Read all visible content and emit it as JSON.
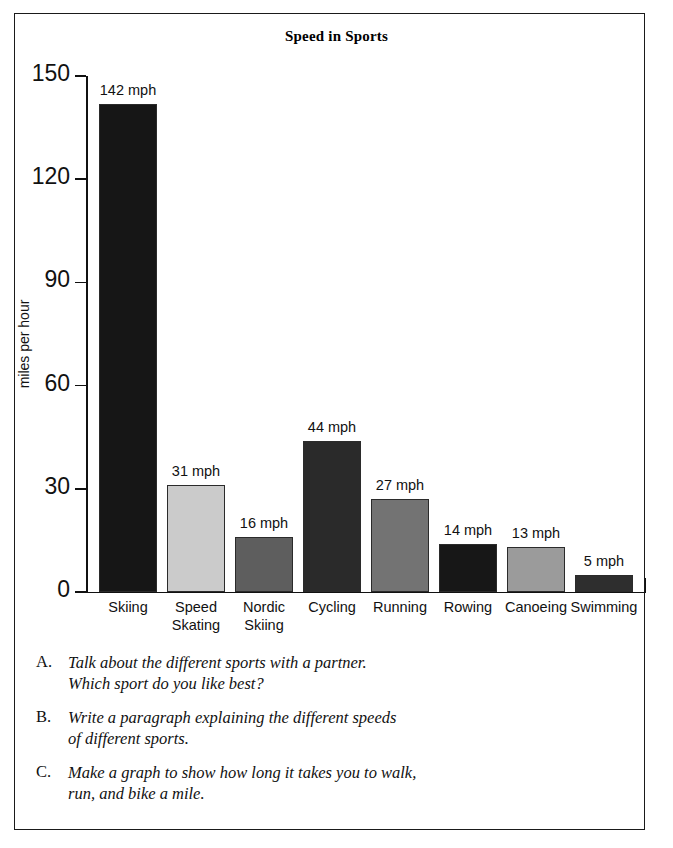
{
  "frame": {
    "border_color": "#1a1a1a"
  },
  "chart_data": {
    "type": "bar",
    "title": "Speed in Sports",
    "xlabel": "",
    "ylabel": "miles per hour",
    "ylim": [
      0,
      150
    ],
    "yticks": [
      0,
      30,
      60,
      90,
      120,
      150
    ],
    "grid": false,
    "legend": false,
    "value_suffix": "mph",
    "categories": [
      "Skiing",
      "Speed Skating",
      "Nordic Skiing",
      "Cycling",
      "Running",
      "Rowing",
      "Canoeing",
      "Swimming"
    ],
    "values": [
      142,
      31,
      16,
      44,
      27,
      14,
      13,
      5
    ],
    "value_labels": [
      "142 mph",
      "31 mph",
      "16 mph",
      "44 mph",
      "27 mph",
      "14 mph",
      "13 mph",
      "5 mph"
    ],
    "category_label_lines": [
      [
        "Skiing"
      ],
      [
        "Speed",
        "Skating"
      ],
      [
        "Nordic",
        "Skiing"
      ],
      [
        "Cycling"
      ],
      [
        "Running"
      ],
      [
        "Rowing"
      ],
      [
        "Canoeing"
      ],
      [
        "Swimming"
      ]
    ],
    "bar_colors": [
      "#161616",
      "#cbcbcb",
      "#5e5e5e",
      "#2a2a2a",
      "#737373",
      "#171717",
      "#9b9b9b",
      "#2e2e2e"
    ]
  },
  "questions": [
    {
      "marker": "A.",
      "text": "Talk about the different sports with a partner.\nWhich sport do you like best?"
    },
    {
      "marker": "B.",
      "text": "Write a paragraph explaining the different speeds\nof different sports."
    },
    {
      "marker": "C.",
      "text": "Make a graph to show how long it takes you to walk,\nrun, and bike a mile."
    }
  ]
}
